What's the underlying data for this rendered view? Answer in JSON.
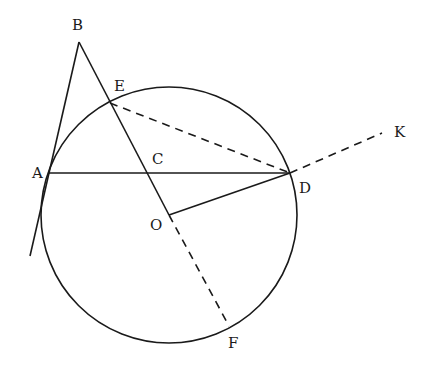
{
  "diagram": {
    "type": "geometry",
    "colors": {
      "stroke": "#1a1a1a",
      "background": "#ffffff"
    },
    "circle": {
      "center": "O",
      "cx": 169,
      "cy": 215,
      "r": 128
    },
    "points": {
      "A": {
        "label": "A",
        "x": 49,
        "y": 173,
        "lx": 32,
        "ly": 178
      },
      "B": {
        "label": "B",
        "x": 79,
        "y": 42,
        "lx": 72,
        "ly": 30
      },
      "C": {
        "label": "C",
        "x": 148,
        "y": 173,
        "lx": 152,
        "ly": 164
      },
      "D": {
        "label": "D",
        "x": 290,
        "y": 173,
        "lx": 299,
        "ly": 193
      },
      "E": {
        "label": "E",
        "x": 110,
        "y": 103,
        "lx": 114,
        "ly": 91
      },
      "F": {
        "label": "F",
        "x": 229,
        "y": 326,
        "lx": 228,
        "ly": 348
      },
      "K": {
        "label": "K",
        "x": 382,
        "y": 133,
        "lx": 394,
        "ly": 137
      },
      "O": {
        "label": "O",
        "x": 169,
        "y": 215,
        "lx": 150,
        "ly": 230
      }
    },
    "segments": {
      "solid": [
        "AB (extended to tangent line)",
        "BO",
        "AD",
        "OD"
      ],
      "dashed": [
        "ED",
        "DK",
        "OF"
      ]
    }
  }
}
